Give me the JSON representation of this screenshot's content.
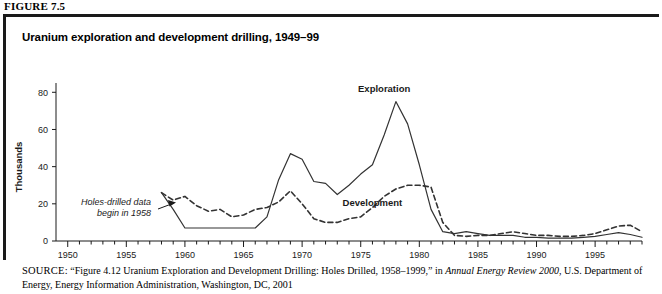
{
  "figure": {
    "label": "FIGURE 7.5",
    "title": "Uranium exploration and development drilling, 1949–99"
  },
  "source": {
    "prefix": "SOURCE:",
    "part1": " “Figure 4.12 Uranium Exploration and Development Drilling: Holes Drilled, 1958–1999,” in ",
    "italic": "Annual Energy Review 2000",
    "part2": ", U.S. Department of Energy, Energy Information Administration, Washington, DC, 2001"
  },
  "annotation": {
    "line1": "Holes-drilled data",
    "line2": "begin in 1958"
  },
  "colors": {
    "ink": "#1a1a1a",
    "line": "#333333",
    "frame": "#1a1a1a",
    "background": "#ffffff"
  },
  "chart_data": {
    "type": "line",
    "title": "Uranium exploration and development drilling, 1949–99",
    "xlabel": "",
    "ylabel": "Thousands",
    "xlim": [
      1949,
      1999
    ],
    "ylim": [
      0,
      85
    ],
    "yticks": [
      0,
      20,
      40,
      60,
      80
    ],
    "ytick_labels": [
      "0",
      "20",
      "40",
      "60",
      "80"
    ],
    "xticks": [
      1950,
      1955,
      1960,
      1965,
      1970,
      1975,
      1980,
      1985,
      1990,
      1995
    ],
    "xtick_labels": [
      "1950",
      "1955",
      "1960",
      "1965",
      "1970",
      "1975",
      "1980",
      "1985",
      "1990",
      "1995"
    ],
    "minor_xtick_interval": 1,
    "grid": false,
    "legend": "inline-labels",
    "note": "Holes-drilled data begin in 1958",
    "series": [
      {
        "name": "Exploration",
        "style": "solid",
        "label_x": 1977,
        "label_y": 80,
        "x": [
          1958,
          1959,
          1960,
          1961,
          1962,
          1963,
          1964,
          1965,
          1966,
          1967,
          1968,
          1969,
          1970,
          1971,
          1972,
          1973,
          1974,
          1975,
          1976,
          1977,
          1978,
          1979,
          1980,
          1981,
          1982,
          1983,
          1984,
          1985,
          1986,
          1987,
          1988,
          1989,
          1990,
          1991,
          1992,
          1993,
          1994,
          1995,
          1996,
          1997,
          1998,
          1999
        ],
        "values": [
          26.0,
          17.0,
          7.0,
          7.0,
          7.0,
          7.0,
          7.0,
          7.0,
          7.0,
          13.0,
          33.0,
          47.0,
          44.0,
          32.0,
          31.0,
          25.0,
          30.0,
          36.0,
          41.0,
          57.0,
          75.0,
          63.0,
          41.0,
          17.0,
          5.0,
          4.0,
          5.0,
          4.0,
          3.0,
          3.0,
          3.0,
          2.0,
          2.0,
          1.5,
          1.5,
          1.5,
          2.0,
          2.5,
          3.5,
          4.5,
          3.5,
          2.0
        ]
      },
      {
        "name": "Development",
        "style": "dashed",
        "label_x": 1976,
        "label_y": 19,
        "x": [
          1958,
          1959,
          1960,
          1961,
          1962,
          1963,
          1964,
          1965,
          1966,
          1967,
          1968,
          1969,
          1970,
          1971,
          1972,
          1973,
          1974,
          1975,
          1976,
          1977,
          1978,
          1979,
          1980,
          1981,
          1982,
          1983,
          1984,
          1985,
          1986,
          1987,
          1988,
          1989,
          1990,
          1991,
          1992,
          1993,
          1994,
          1995,
          1996,
          1997,
          1998,
          1999
        ],
        "values": [
          26.0,
          22.0,
          24.0,
          19.0,
          16.0,
          17.0,
          13.0,
          14.0,
          17.0,
          18.0,
          21.0,
          27.0,
          20.0,
          12.0,
          10.0,
          10.0,
          12.0,
          13.0,
          18.0,
          24.0,
          28.0,
          30.0,
          30.0,
          29.0,
          10.0,
          3.0,
          2.5,
          3.0,
          3.0,
          4.0,
          5.0,
          4.0,
          3.0,
          3.0,
          2.5,
          2.5,
          3.0,
          4.0,
          6.0,
          8.0,
          8.5,
          5.0
        ]
      }
    ]
  }
}
